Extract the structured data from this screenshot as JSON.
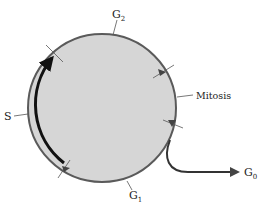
{
  "diagram": {
    "colors": {
      "cell_fill": "#d6d6d6",
      "cell_outline": "#555555",
      "s_phase_stroke": "#111111",
      "text": "#222222"
    },
    "phases": [
      {
        "id": "G2",
        "label": "G",
        "sub": "2"
      },
      {
        "id": "mitosis",
        "label": "Mitosis"
      },
      {
        "id": "G1",
        "label": "G",
        "sub": "1"
      },
      {
        "id": "S",
        "label": "S"
      },
      {
        "id": "G0",
        "label": "G",
        "sub": "0"
      }
    ]
  }
}
